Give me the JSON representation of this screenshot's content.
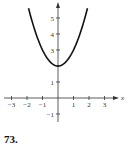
{
  "problem": {
    "number": "73."
  },
  "colors": {
    "axis": "#333333",
    "curve": "#111111",
    "text": "#333333"
  },
  "chart_data": {
    "type": "line",
    "title": "",
    "xlabel": "x",
    "ylabel": "",
    "xlim": [
      -3.4,
      3.8
    ],
    "ylim": [
      -1.4,
      5.8
    ],
    "grid": false,
    "legend": null,
    "x_ticks": [
      -3,
      -2,
      -1,
      1,
      2,
      3
    ],
    "x_tick_labels": [
      "−3",
      "−2",
      "−1",
      "1",
      "2",
      "3"
    ],
    "y_ticks": [
      -1,
      1,
      2,
      3,
      4,
      5
    ],
    "y_tick_labels": [
      "−1",
      "1",
      "",
      "3",
      "4",
      "5"
    ],
    "series": [
      {
        "name": "y = x^2 + 2",
        "x": [
          -1.9,
          -1.5,
          -1,
          -0.5,
          0,
          0.5,
          1,
          1.5,
          1.9
        ],
        "y": [
          5.61,
          4.25,
          3,
          2.25,
          2,
          2.25,
          3,
          4.25,
          5.61
        ]
      }
    ],
    "annotations": []
  }
}
